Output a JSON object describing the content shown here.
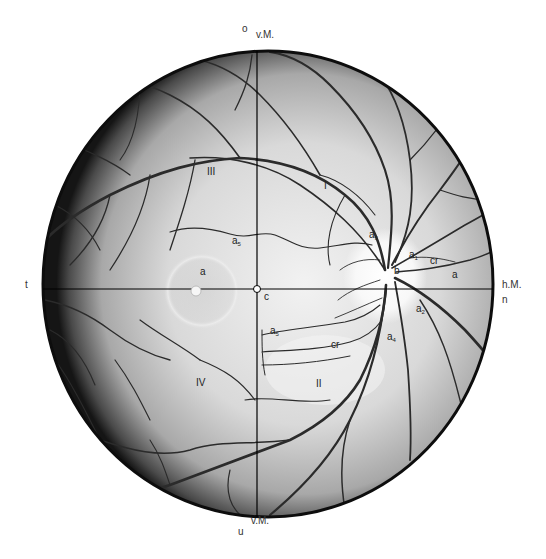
{
  "figure": {
    "colors": {
      "background": "#ffffff",
      "fundus_center": "#e8e8e8",
      "fundus_edge": "#1a1a1a",
      "vessels": "#2b2b2b",
      "axes": "#000000"
    }
  },
  "orientation_labels": {
    "top_o": "o",
    "top_meridian": "v.M.",
    "left_t": "t",
    "right_meridian": "h.M.",
    "right_n": "n",
    "bottom_meridian": "v.M.",
    "bottom_u": "u"
  },
  "quadrants": {
    "q1": "I",
    "q2": "II",
    "q3": "III",
    "q4": "IV"
  },
  "structure_labels": {
    "macula": "a",
    "fovea_center": "c",
    "optic_disc": "b",
    "a1": {
      "base": "a",
      "sub": "1"
    },
    "a2": {
      "base": "a",
      "sub": "2"
    },
    "a3": {
      "base": "a",
      "sub": "3"
    },
    "a4": {
      "base": "a",
      "sub": "4"
    },
    "a5_upper": {
      "base": "a",
      "sub": "5"
    },
    "a5_lower": {
      "base": "a",
      "sub": "5"
    },
    "a_nasal": "a",
    "cr_nasal": "cr",
    "cr_lower": "cr"
  }
}
